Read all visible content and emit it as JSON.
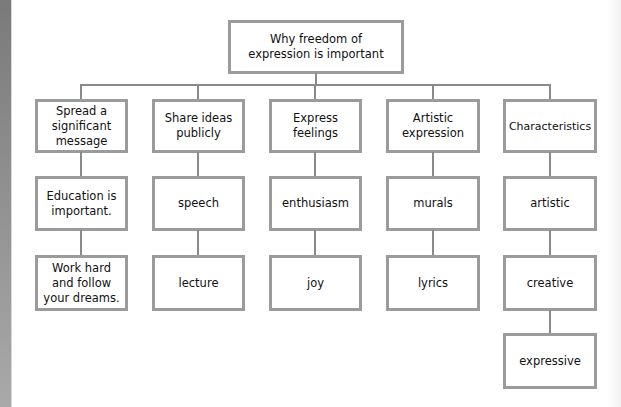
{
  "diagram": {
    "colors": {
      "border": "#9b9b9b",
      "connector": "#8a8a8a",
      "text": "#111111",
      "background": "#ffffff"
    },
    "root": {
      "label": "Why freedom of expression is important"
    },
    "columns": [
      {
        "label": "Spread a significant message",
        "children": [
          "Education is important.",
          "Work hard and follow your dreams."
        ]
      },
      {
        "label": "Share ideas publicly",
        "children": [
          "speech",
          "lecture"
        ]
      },
      {
        "label": "Express feelings",
        "children": [
          "enthusiasm",
          "joy"
        ]
      },
      {
        "label": "Artistic expression",
        "children": [
          "murals",
          "lyrics"
        ]
      },
      {
        "label": "Characteristics",
        "children": [
          "artistic",
          "creative",
          "expressive"
        ]
      }
    ]
  }
}
